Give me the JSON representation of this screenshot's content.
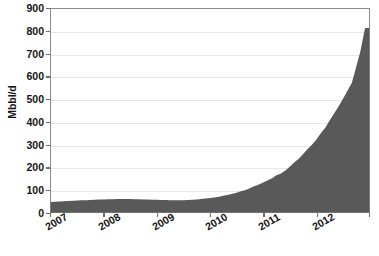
{
  "chart_data": {
    "type": "area",
    "title": "",
    "subtitle": "",
    "xlabel": "",
    "ylabel": "Mbbl/d",
    "ylim": [
      0,
      900
    ],
    "xlim": [
      "2007",
      "2013"
    ],
    "grid": true,
    "legend": "none",
    "fill_color": "#595959",
    "axis_color": "#8a8a8a",
    "grid_color": "#e6e6e6",
    "ytick_labels": [
      "900",
      "800",
      "700",
      "600",
      "500",
      "400",
      "300",
      "200",
      "100",
      "0"
    ],
    "ytick_values": [
      900,
      800,
      700,
      600,
      500,
      400,
      300,
      200,
      100,
      0
    ],
    "xtick_labels": [
      "2007",
      "2008",
      "2009",
      "2010",
      "2011",
      "2012"
    ],
    "xtick_values": [
      2007,
      2008,
      2009,
      2010,
      2011,
      2012
    ],
    "series": [
      {
        "name": "Production",
        "x": [
          2007.0,
          2007.08,
          2007.17,
          2007.25,
          2007.33,
          2007.42,
          2007.5,
          2007.58,
          2007.67,
          2007.75,
          2007.83,
          2007.92,
          2008.0,
          2008.08,
          2008.17,
          2008.25,
          2008.33,
          2008.42,
          2008.5,
          2008.58,
          2008.67,
          2008.75,
          2008.83,
          2008.92,
          2009.0,
          2009.08,
          2009.17,
          2009.25,
          2009.33,
          2009.42,
          2009.5,
          2009.58,
          2009.67,
          2009.75,
          2009.83,
          2009.92,
          2010.0,
          2010.08,
          2010.17,
          2010.25,
          2010.33,
          2010.42,
          2010.5,
          2010.58,
          2010.67,
          2010.75,
          2010.83,
          2010.92,
          2011.0,
          2011.08,
          2011.17,
          2011.25,
          2011.33,
          2011.42,
          2011.5,
          2011.58,
          2011.67,
          2011.75,
          2011.83,
          2011.92,
          2012.0,
          2012.08,
          2012.17,
          2012.25,
          2012.33,
          2012.42,
          2012.5,
          2012.58,
          2012.67,
          2012.75,
          2012.83,
          2012.92
        ],
        "values": [
          47,
          48,
          49,
          50,
          51,
          52,
          53,
          54,
          55,
          56,
          57,
          58,
          58,
          59,
          59,
          60,
          60,
          60,
          60,
          59,
          59,
          58,
          58,
          57,
          57,
          56,
          56,
          55,
          55,
          55,
          55,
          56,
          57,
          58,
          60,
          62,
          64,
          67,
          70,
          74,
          78,
          83,
          88,
          94,
          100,
          108,
          116,
          124,
          133,
          142,
          152,
          165,
          172,
          186,
          202,
          220,
          238,
          258,
          278,
          300,
          322,
          348,
          375,
          405,
          435,
          468,
          500,
          535,
          572,
          640,
          710,
          815
        ]
      }
    ],
    "annotations": []
  }
}
